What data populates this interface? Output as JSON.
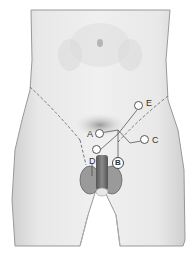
{
  "diagram": {
    "markers": [
      {
        "id": "A",
        "label": "A",
        "x": 96,
        "y": 133
      },
      {
        "id": "B",
        "label": "B",
        "x": 118,
        "y": 163
      },
      {
        "id": "C",
        "label": "C",
        "x": 145,
        "y": 139
      },
      {
        "id": "D",
        "label": "D",
        "x": 92,
        "y": 161
      },
      {
        "id": "E",
        "label": "E",
        "x": 139,
        "y": 106
      }
    ],
    "marker_unlabeled": {
      "x": 96,
      "y": 148
    },
    "colors": {
      "skin": "#e6e6e6",
      "outline": "#8a8a8a",
      "dashed_line": "#777777",
      "shaft": "#6e6e6e",
      "background": "#ffffff"
    }
  }
}
